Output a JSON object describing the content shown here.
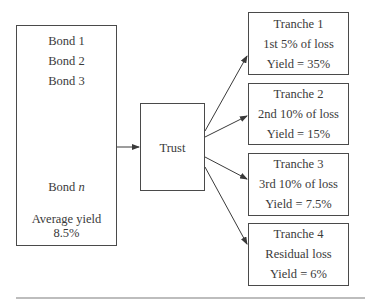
{
  "pool": {
    "bonds": [
      "Bond 1",
      "Bond 2",
      "Bond 3"
    ],
    "last_bond_prefix": "Bond",
    "last_bond_var": "n",
    "avg_yield_label": "Average yield",
    "avg_yield_value": "8.5%"
  },
  "trust": {
    "label": "Trust"
  },
  "tranches": [
    {
      "name": "Tranche 1",
      "loss": "1st 5% of loss",
      "yield": "Yield = 35%"
    },
    {
      "name": "Tranche 2",
      "loss": "2nd 10% of loss",
      "yield": "Yield = 15%"
    },
    {
      "name": "Tranche 3",
      "loss": "3rd 10% of loss",
      "yield": "Yield = 7.5%"
    },
    {
      "name": "Tranche 4",
      "loss": "Residual loss",
      "yield": "Yield = 6%"
    }
  ],
  "colors": {
    "line": "#4a4a4a",
    "text": "#3a3a3a",
    "rule": "#bdbdbd"
  }
}
